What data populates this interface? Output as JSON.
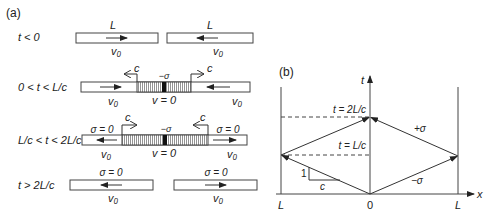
{
  "panel_a": {
    "label": "(a)",
    "rows": [
      {
        "condition": "t < 0",
        "left_top": "L",
        "right_top": "L",
        "left_bottom": "v₀",
        "right_bottom": "v₀"
      },
      {
        "condition": "0 < t < L/c",
        "wave_left": "c",
        "wave_right": "c",
        "stress_mid": "−σ",
        "left_bottom": "v₀",
        "mid_bottom": "v = 0",
        "right_bottom": "v₀"
      },
      {
        "condition": "L/c < t < 2L/c",
        "wave_left": "c",
        "wave_right": "c",
        "stress_left": "σ = 0",
        "stress_mid": "−σ",
        "stress_right": "σ = 0",
        "left_bottom": "v₀",
        "mid_bottom": "v = 0",
        "right_bottom": "v₀"
      },
      {
        "condition": "t > 2L/c",
        "left_top": "σ = 0",
        "right_top": "σ = 0",
        "left_bottom": "v₀",
        "right_bottom": "v₀"
      }
    ]
  },
  "panel_b": {
    "label": "(b)",
    "t_axis": "t",
    "x_axis": "x",
    "x_ticks": [
      "L",
      "0",
      "L"
    ],
    "t_2Lc": "t = 2L/c",
    "t_Lc": "t = L/c",
    "plus_sigma": "+σ",
    "minus_sigma": "−σ",
    "slope_rise": "1",
    "slope_run": "c"
  }
}
